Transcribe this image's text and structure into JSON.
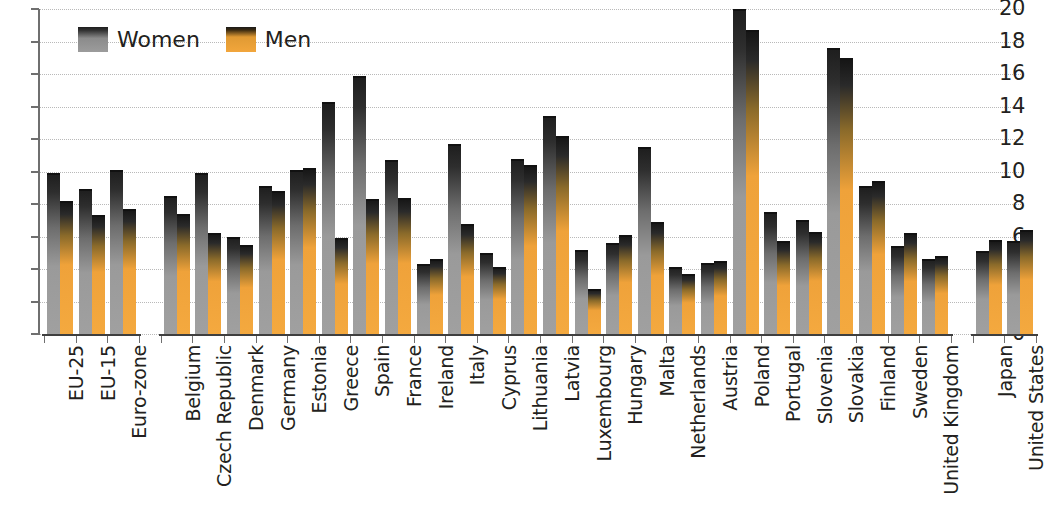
{
  "chart_data": {
    "type": "bar",
    "title": "",
    "subtitle": "",
    "xlabel": "",
    "ylabel": "",
    "ylim": [
      0,
      20
    ],
    "ytick_labels": [
      "20",
      "18",
      "16",
      "14",
      "12",
      "10",
      "8",
      "6",
      "4",
      "2",
      "0"
    ],
    "yticks": [
      20,
      18,
      16,
      14,
      12,
      10,
      8,
      6,
      4,
      2,
      0
    ],
    "grid": true,
    "legend_position": "top-left",
    "legend": [
      "Women",
      "Men"
    ],
    "colors": {
      "women": "#9a9a9a",
      "men": "#f2a33c",
      "bar_top": "#1d1d1d",
      "axis": "#6f6f6f",
      "gridline": "#b9b9b9",
      "text": "#231f20",
      "background": "#ffffff"
    },
    "categories": [
      "EU-25",
      "EU-15",
      "Euro-zone",
      "Belgium",
      "Czech Republic",
      "Denmark",
      "Germany",
      "Estonia",
      "Greece",
      "Spain",
      "France",
      "Ireland",
      "Italy",
      "Cyprus",
      "Lithuania",
      "Latvia",
      "Luxembourg",
      "Hungary",
      "Malta",
      "Netherlands",
      "Austria",
      "Poland",
      "Portugal",
      "Slovenia",
      "Slovakia",
      "Finland",
      "Sweden",
      "United Kingdom",
      "Japan",
      "United States"
    ],
    "groups": [
      {
        "name": "aggregates",
        "categories": [
          "EU-25",
          "EU-15",
          "Euro-zone"
        ]
      },
      {
        "name": "eu-members",
        "categories": [
          "Belgium",
          "Czech Republic",
          "Denmark",
          "Germany",
          "Estonia",
          "Greece",
          "Spain",
          "France",
          "Ireland",
          "Italy",
          "Cyprus",
          "Lithuania",
          "Latvia",
          "Luxembourg",
          "Hungary",
          "Malta",
          "Netherlands",
          "Austria",
          "Poland",
          "Portugal",
          "Slovenia",
          "Slovakia",
          "Finland",
          "Sweden",
          "United Kingdom"
        ]
      },
      {
        "name": "non-eu",
        "categories": [
          "Japan",
          "United States"
        ]
      }
    ],
    "series": [
      {
        "name": "Women",
        "values": [
          9.9,
          8.9,
          10.1,
          8.5,
          9.9,
          6.0,
          9.1,
          10.1,
          14.3,
          15.9,
          10.7,
          4.3,
          11.7,
          5.0,
          10.8,
          13.4,
          5.2,
          5.6,
          11.5,
          4.1,
          4.4,
          20.0,
          7.5,
          7.0,
          17.6,
          9.1,
          5.4,
          4.6,
          5.1,
          5.7
        ]
      },
      {
        "name": "Men",
        "values": [
          8.2,
          7.3,
          7.7,
          7.4,
          6.2,
          5.5,
          8.8,
          10.2,
          5.9,
          8.3,
          8.4,
          4.6,
          6.8,
          4.1,
          10.4,
          12.2,
          2.8,
          6.1,
          6.9,
          3.7,
          4.5,
          18.7,
          5.7,
          6.3,
          17.0,
          9.4,
          6.2,
          4.8,
          5.8,
          6.4
        ]
      }
    ]
  },
  "layout": {
    "plot_left": 40,
    "plot_right": 1023,
    "plot_top": 9,
    "plot_bottom": 334,
    "group_gaps": [
      {
        "after_category_index": 2,
        "gap_px": 22
      },
      {
        "after_category_index": 27,
        "gap_px": 22
      }
    ]
  }
}
